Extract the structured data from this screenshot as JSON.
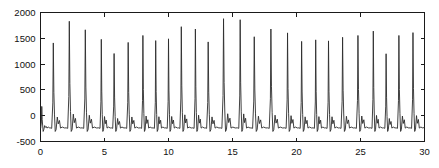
{
  "chart_data": {
    "type": "line",
    "title": "",
    "subtitle": "",
    "xlabel": "",
    "ylabel": "",
    "xlim": [
      0,
      30
    ],
    "ylim": [
      -500,
      2000
    ],
    "xticks": [
      0,
      5,
      10,
      15,
      20,
      25,
      30
    ],
    "yticks": [
      -500,
      0,
      500,
      1000,
      1500,
      2000
    ],
    "xtick_labels": [
      "0",
      "5",
      "10",
      "15",
      "20",
      "25",
      "30"
    ],
    "ytick_labels": [
      "-500",
      "0",
      "500",
      "1000",
      "1500",
      "2000"
    ],
    "grid": false,
    "legend": null,
    "legend_position": "none",
    "line_color": "#2b2b2b",
    "axis_color": "#1a1a1a",
    "background_color": "#ffffff",
    "series": [
      {
        "name": "pulse-signal",
        "baseline": -250,
        "beat_count": 27,
        "beats": [
          {
            "t": 0.1,
            "peak": 180
          },
          {
            "t": 1.0,
            "peak": 1410
          },
          {
            "t": 2.25,
            "peak": 1830
          },
          {
            "t": 3.5,
            "peak": 1665
          },
          {
            "t": 4.75,
            "peak": 1480
          },
          {
            "t": 5.75,
            "peak": 1205
          },
          {
            "t": 6.85,
            "peak": 1420
          },
          {
            "t": 8.0,
            "peak": 1555
          },
          {
            "t": 9.0,
            "peak": 1455
          },
          {
            "t": 10.0,
            "peak": 1490
          },
          {
            "t": 11.0,
            "peak": 1725
          },
          {
            "t": 12.1,
            "peak": 1680
          },
          {
            "t": 13.1,
            "peak": 1430
          },
          {
            "t": 14.3,
            "peak": 1880
          },
          {
            "t": 15.6,
            "peak": 1860
          },
          {
            "t": 16.7,
            "peak": 1530
          },
          {
            "t": 18.0,
            "peak": 1680
          },
          {
            "t": 19.3,
            "peak": 1605
          },
          {
            "t": 20.4,
            "peak": 1440
          },
          {
            "t": 21.5,
            "peak": 1470
          },
          {
            "t": 22.5,
            "peak": 1450
          },
          {
            "t": 23.6,
            "peak": 1520
          },
          {
            "t": 24.8,
            "peak": 1555
          },
          {
            "t": 26.0,
            "peak": 1640
          },
          {
            "t": 27.0,
            "peak": 1200
          },
          {
            "t": 28.0,
            "peak": 1555
          },
          {
            "t": 29.1,
            "peak": 1610
          }
        ]
      }
    ]
  }
}
